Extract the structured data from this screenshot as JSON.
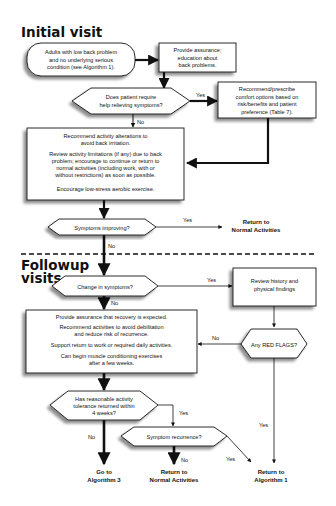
{
  "sections": {
    "initial": "Initial visit",
    "followup_line1": "Followup",
    "followup_line2": "visits"
  },
  "nodes": {
    "start": [
      "Adults with low back problem",
      "and no underlying serious",
      "condition (see Algorithm 1)."
    ],
    "assurance": [
      "Provide assurance;",
      "education about",
      "back problems."
    ],
    "q_relief": [
      "Does patient require",
      "help relieving symptoms?"
    ],
    "comfort": [
      "Recommend/prescribe",
      "comfort options based on",
      "risk/benefits and patient",
      "preference (Table 7)."
    ],
    "activity_box": [
      "Recommend activity alterations to",
      "avoid back irritation.",
      "Review activity limitations (if any) due to back",
      "problem; encourage to continue or return to",
      "normal activities (including work, with or",
      "without restrictions) as soon as possible.",
      "Encourage low-stress aerobic exercise."
    ],
    "q_improving": [
      "Symptoms improving?"
    ],
    "return_normal_1": [
      "Return to",
      "Normal Activities"
    ],
    "q_change": [
      "Change in symptoms?"
    ],
    "review": [
      "Review history and",
      "physical findings"
    ],
    "q_red_flags": [
      "Any RED FLAGS?"
    ],
    "followup_box": [
      "Provide assurance that recovery is expected.",
      "Recommend activities to avoid debilitation",
      "and reduce risk of recurrence.",
      "Support return to work or required daily activities.",
      "Can begin muscle conditioning exercises",
      "after a few weeks."
    ],
    "q_tolerance": [
      "Has reasonable activity",
      "tolerance returned within",
      "4 weeks?"
    ],
    "q_recurrence": [
      "Symptom recurrence?"
    ],
    "go_alg3": [
      "Go to",
      "Algorithm 3"
    ],
    "return_normal_2": [
      "Return to",
      "Normal Activities"
    ],
    "return_alg1": [
      "Return to",
      "Algorithm 1"
    ]
  },
  "edges": {
    "relief_yes": "Yes",
    "relief_no": "No",
    "improving_yes": "Yes",
    "improving_no": "No",
    "change_yes": "Yes",
    "change_no": "No",
    "redflags_no": "No",
    "redflags_yes": "Yes",
    "tolerance_yes": "Yes",
    "tolerance_no": "No",
    "recurrence_no": "No",
    "recurrence_yes": "Yes"
  }
}
